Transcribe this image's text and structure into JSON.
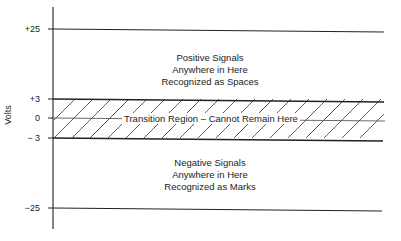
{
  "diagram": {
    "y_axis_label": "Volts",
    "levels": [
      {
        "label": "+25",
        "value": 25
      },
      {
        "label": "+3",
        "value": 3
      },
      {
        "label": "0",
        "value": 0
      },
      {
        "label": "− 3",
        "value": -3
      },
      {
        "label": "−25",
        "value": -25
      }
    ],
    "positive_region": {
      "lines": [
        "Positive Signals",
        "Anywhere in Here",
        "Recognized as Spaces"
      ]
    },
    "transition_region": {
      "label": "Transition Region – Cannot Remain Here",
      "fill": "diagonal-hatch"
    },
    "negative_region": {
      "lines": [
        "Negative Signals",
        "Anywhere in Here",
        "Recognized as Marks"
      ]
    },
    "colors": {
      "line": "#222222",
      "background": "#ffffff"
    }
  }
}
